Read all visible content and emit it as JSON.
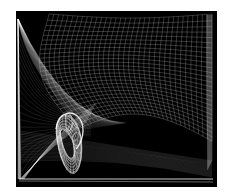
{
  "image": {
    "description": "Abstract white wireframe mesh surfaces on black background",
    "background": "#000000",
    "line_color": "#ffffff",
    "border_color": "#ffffff"
  }
}
